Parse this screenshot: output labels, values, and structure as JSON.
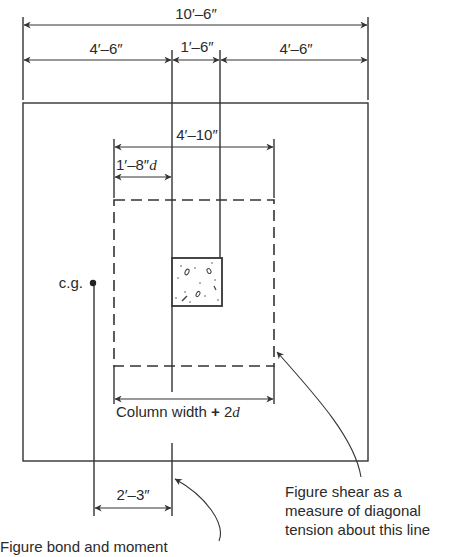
{
  "diagram": {
    "dimensions": {
      "overall_width": "10′–6″",
      "left_offset": "4′–6″",
      "column_width": "1′–6″",
      "right_offset": "4′–6″",
      "critical_section_width": "4′–10″",
      "half_critical_offset": "1′–8″",
      "half_critical_offset_suffix": "d",
      "cg_offset": "2′–3″"
    },
    "labels": {
      "cg": "c.g.",
      "column_width_plus": "Column width",
      "plus_sign": "+",
      "two_d": "2d",
      "shear_note_line1": "Figure shear as a",
      "shear_note_line2": "measure of diagonal",
      "shear_note_line3": "tension about this line",
      "bond_note": "Figure bond and moment"
    },
    "colors": {
      "line": "#333333",
      "text": "#2a2a2a",
      "background": "#ffffff"
    }
  }
}
